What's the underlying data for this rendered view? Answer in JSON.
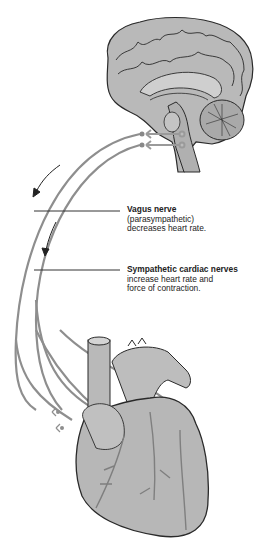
{
  "diagram": {
    "labels": [
      {
        "id": "vagus",
        "title": "Vagus nerve",
        "lines": [
          "(parasympathetic)",
          "decreases heart rate."
        ]
      },
      {
        "id": "sympathetic",
        "title": "Sympathetic cardiac nerves",
        "lines": [
          "increase heart rate and",
          "force of contraction."
        ]
      }
    ],
    "structures": [
      "brain",
      "brainstem",
      "spinal cord",
      "heart",
      "nerve pathways",
      "direction arrows"
    ],
    "colors": {
      "tissue_fill": "#b9b9b9",
      "outline": "#2a2a2a",
      "nerve": "#8a8a8a",
      "leader_line": "#333333"
    }
  }
}
